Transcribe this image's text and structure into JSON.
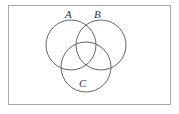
{
  "figure": {
    "kind": "venn-diagram",
    "title": "",
    "background_color": "#ffffff",
    "frame": {
      "visible": true,
      "border_color": "#a9a9a9",
      "border_width_px": 1,
      "left_px": 8,
      "top_px": 5,
      "width_px": 163,
      "height_px": 100
    },
    "stroke_color": "#555555",
    "stroke_width_px": 0.9,
    "fill": "none",
    "sets": [
      {
        "id": "A",
        "label": "A",
        "label_position": "above-left",
        "center_x": 71,
        "center_y": 45,
        "radius": 25
      },
      {
        "id": "B",
        "label": "B",
        "label_position": "above-right",
        "center_x": 101,
        "center_y": 45,
        "radius": 25
      },
      {
        "id": "C",
        "label": "C",
        "label_position": "inside-bottom",
        "center_x": 86,
        "center_y": 67,
        "radius": 25
      }
    ],
    "regions": [
      "A only",
      "B only",
      "C only",
      "A and B",
      "A and C",
      "B and C",
      "A and B and C"
    ]
  }
}
